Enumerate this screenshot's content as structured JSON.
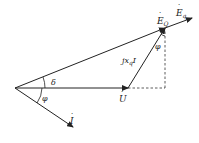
{
  "diagram": {
    "type": "phasor-diagram",
    "colors": {
      "stroke": "#222222",
      "background": "#ffffff"
    },
    "labels": {
      "E_q": {
        "base": "E",
        "sub": "q",
        "accent": "dot"
      },
      "E_Q": {
        "base": "E",
        "sub": "Q",
        "accent": "dot"
      },
      "jxqI": {
        "prefix": "jx",
        "sub": "q",
        "suffix": "I",
        "accent": "dot on I"
      },
      "U": {
        "base": "U",
        "accent": "dot"
      },
      "I": {
        "base": "I",
        "accent": "dot"
      },
      "delta": "δ",
      "phi_origin": "φ",
      "phi_top": "φ"
    },
    "vectors": [
      {
        "name": "U",
        "from": [
          15,
          88
        ],
        "to": [
          128,
          88
        ]
      },
      {
        "name": "E_Q",
        "from": [
          15,
          88
        ],
        "to": [
          165,
          28
        ]
      },
      {
        "name": "E_q",
        "from": [
          165,
          28
        ],
        "to": [
          192,
          18
        ]
      },
      {
        "name": "jxqI",
        "from": [
          128,
          88
        ],
        "to": [
          165,
          28
        ]
      },
      {
        "name": "I",
        "from": [
          15,
          88
        ],
        "to": [
          73,
          127
        ]
      }
    ],
    "dashed": [
      {
        "from": [
          128,
          88
        ],
        "to": [
          165,
          88
        ]
      },
      {
        "from": [
          165,
          88
        ],
        "to": [
          165,
          28
        ]
      }
    ]
  }
}
